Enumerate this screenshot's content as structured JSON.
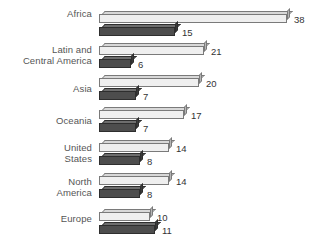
{
  "chart_data": {
    "type": "bar",
    "orientation": "horizontal",
    "title": "",
    "subtitle": "",
    "xlabel": "",
    "ylabel": "",
    "grid": false,
    "legend": null,
    "xlim": [
      0,
      38
    ],
    "categories": [
      "Africa",
      "Latin and\nCentral America",
      "Asia",
      "Oceania",
      "United\nStates",
      "North\nAmerica",
      "Europe"
    ],
    "series": [
      {
        "name": "light",
        "values": [
          38,
          21,
          20,
          17,
          14,
          14,
          10
        ]
      },
      {
        "name": "dark",
        "values": [
          15,
          6,
          7,
          7,
          8,
          8,
          11
        ]
      }
    ],
    "data_labels": [
      "38",
      "15",
      "21",
      "6",
      "20",
      "7",
      "17",
      "7",
      "14",
      "8",
      "14",
      "8",
      "10",
      "11"
    ],
    "colors": {
      "light_face": "#efefef",
      "light_edge": "#7a7a7a",
      "dark_face": "#4d4d4d",
      "dark_edge": "#2e2e2e",
      "label_text": "#555555",
      "value_text": "#333333",
      "background": "#ffffff"
    }
  },
  "rows": [
    {
      "label": "Africa",
      "label_top": 9,
      "light": {
        "value": 38,
        "text": "38",
        "top": 14,
        "width": 188
      },
      "dark": {
        "value": 15,
        "text": "15",
        "top": 27,
        "width": 76
      }
    },
    {
      "label": "Latin and\nCentral America",
      "label_top": 45,
      "light": {
        "value": 21,
        "text": "21",
        "top": 46,
        "width": 105
      },
      "dark": {
        "value": 6,
        "text": "6",
        "top": 59,
        "width": 32
      }
    },
    {
      "label": "Asia",
      "label_top": 84,
      "light": {
        "value": 20,
        "text": "20",
        "top": 78,
        "width": 100
      },
      "dark": {
        "value": 7,
        "text": "7",
        "top": 91,
        "width": 37
      }
    },
    {
      "label": "Oceania",
      "label_top": 116,
      "light": {
        "value": 17,
        "text": "17",
        "top": 110,
        "width": 85
      },
      "dark": {
        "value": 7,
        "text": "7",
        "top": 123,
        "width": 37
      }
    },
    {
      "label": "United\nStates",
      "label_top": 143,
      "light": {
        "value": 14,
        "text": "14",
        "top": 143,
        "width": 70
      },
      "dark": {
        "value": 8,
        "text": "8",
        "top": 156,
        "width": 41
      }
    },
    {
      "label": "North\nAmerica",
      "label_top": 177,
      "light": {
        "value": 14,
        "text": "14",
        "top": 176,
        "width": 70
      },
      "dark": {
        "value": 8,
        "text": "8",
        "top": 189,
        "width": 41
      }
    },
    {
      "label": "Europe",
      "label_top": 214,
      "light": {
        "value": 10,
        "text": "10",
        "top": 212,
        "width": 51
      },
      "dark": {
        "value": 11,
        "text": "11",
        "top": 225,
        "width": 56
      }
    }
  ]
}
